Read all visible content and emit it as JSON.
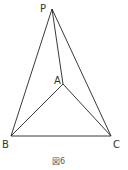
{
  "figure": {
    "caption": "図6",
    "points": {
      "P": {
        "label": "P",
        "x": 52,
        "y": 9
      },
      "A": {
        "label": "A",
        "x": 63,
        "y": 84
      },
      "B": {
        "label": "B",
        "x": 11,
        "y": 136
      },
      "C": {
        "label": "C",
        "x": 111,
        "y": 136
      }
    },
    "segments": [
      "PB",
      "PA",
      "PC",
      "AB",
      "AC",
      "BC"
    ],
    "line_color": "#222222"
  }
}
